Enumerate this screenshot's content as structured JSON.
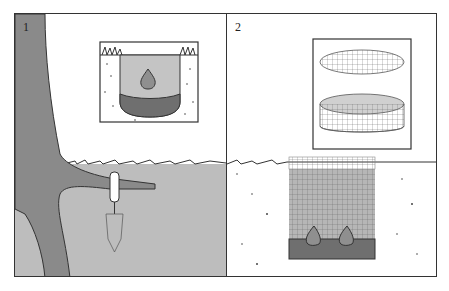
{
  "figure": {
    "panels": [
      {
        "label": "1",
        "description": "Tree with root and trowel planted in ground; inset shows hole with bulb on gravel base"
      },
      {
        "label": "2",
        "description": "Wire mesh cage with lid; hole lined with mesh cage holding two bulbs on gravel base"
      }
    ],
    "colors": {
      "tree": "#8a8a8a",
      "soil_panel1": "#bdbdbd",
      "hole_fill": "#c4c4c4",
      "bulb": "#8f8f8f",
      "gravel": "#6f6f6f",
      "outline": "#333333"
    }
  }
}
